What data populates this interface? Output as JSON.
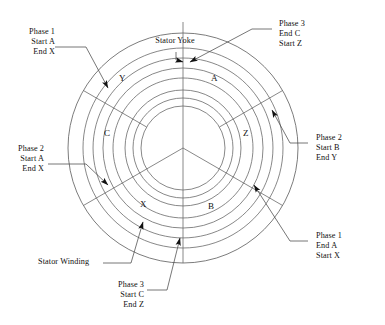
{
  "diagram": {
    "title_labels": {
      "stator_yoke": "Stator Yoke",
      "stator_winding": "Stator Winding"
    },
    "callouts": [
      {
        "id": "phase1-start-a",
        "lines": [
          "Phase 1",
          "Start A",
          "End X"
        ]
      },
      {
        "id": "phase3-end-c",
        "lines": [
          "Phase 3",
          "End C",
          "Start Z"
        ]
      },
      {
        "id": "phase2-start-b",
        "lines": [
          "Phase 2",
          "Start B",
          "End Y"
        ]
      },
      {
        "id": "phase2-start-a",
        "lines": [
          "Phase 2",
          "Start A",
          "End X"
        ]
      },
      {
        "id": "phase1-end-a",
        "lines": [
          "Phase 1",
          "End A",
          "Start X"
        ]
      },
      {
        "id": "phase3-start-c",
        "lines": [
          "Phase 3",
          "Start C",
          "End Z"
        ]
      }
    ],
    "coil_sides": [
      {
        "id": "coil-y",
        "label": "Y"
      },
      {
        "id": "coil-a",
        "label": "A"
      },
      {
        "id": "coil-c",
        "label": "C"
      },
      {
        "id": "coil-z",
        "label": "Z"
      },
      {
        "id": "coil-x",
        "label": "X"
      },
      {
        "id": "coil-b",
        "label": "B"
      }
    ],
    "colors": {
      "line": "#4a4a4a",
      "outline": "#5a5a5a",
      "text": "#101010",
      "background": "#ffffff"
    }
  }
}
